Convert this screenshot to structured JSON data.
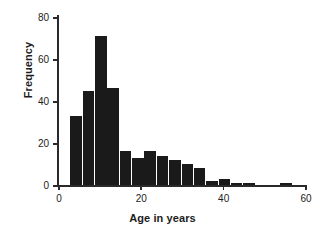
{
  "chart_data": {
    "type": "bar",
    "title": "",
    "subtitle": "",
    "xlabel": "Age in years",
    "ylabel": "Frequency",
    "xlim": [
      0,
      60
    ],
    "ylim": [
      0,
      80
    ],
    "bin_width": 3,
    "grid": false,
    "legend": null,
    "annotations": [],
    "xticks": [
      0,
      20,
      40,
      60
    ],
    "xtick_labels": [
      "0",
      "20",
      "40",
      "60"
    ],
    "yticks": [
      0,
      20,
      40,
      60,
      80
    ],
    "ytick_labels": [
      "0",
      "20",
      "40",
      "60",
      "80"
    ],
    "bar_color": "#1a1a1a",
    "bin_starts": [
      3,
      6,
      9,
      12,
      15,
      18,
      21,
      24,
      27,
      30,
      33,
      36,
      39,
      42,
      45,
      48,
      51,
      54,
      57
    ],
    "categories": [
      "3-6",
      "6-9",
      "9-12",
      "12-15",
      "15-18",
      "18-21",
      "21-24",
      "24-27",
      "27-30",
      "30-33",
      "33-36",
      "36-39",
      "39-42",
      "42-45",
      "45-48",
      "48-51",
      "51-54",
      "54-57",
      "57-60"
    ],
    "values": [
      33,
      45,
      71,
      46,
      16,
      13,
      16,
      14,
      12,
      10,
      8,
      2,
      3,
      1,
      1,
      0,
      0,
      1,
      0
    ]
  }
}
